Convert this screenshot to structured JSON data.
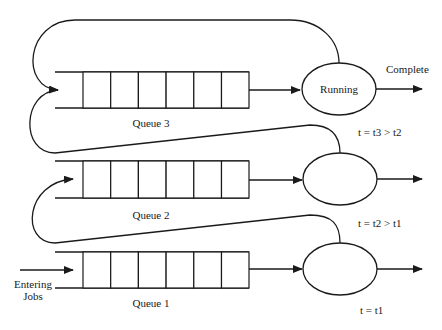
{
  "diagram": {
    "type": "multilevel-feedback-queue",
    "queues": [
      {
        "id": "queue3",
        "label": "Queue 3",
        "cells": 6,
        "processor_label": "Running",
        "output_label": "Complete",
        "time_label": "t = t3 > t2"
      },
      {
        "id": "queue2",
        "label": "Queue 2",
        "cells": 6,
        "processor_label": "",
        "time_label": "t = t2 > t1"
      },
      {
        "id": "queue1",
        "label": "Queue 1",
        "cells": 6,
        "processor_label": "",
        "time_label": "t = t1"
      }
    ],
    "entry_label_line1": "Entering",
    "entry_label_line2": "Jobs",
    "colors": {
      "stroke": "#1a1a1a",
      "background": "#ffffff"
    }
  }
}
